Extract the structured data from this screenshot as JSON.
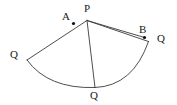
{
  "figure": {
    "type": "geometry-diagram",
    "canvas": {
      "width": 177,
      "height": 105
    },
    "colors": {
      "background": "#ffffff",
      "stroke": "#3a3a3a",
      "label": "#1a1a1a",
      "marker": "#111111"
    },
    "stroke_width": 0.9,
    "labels": [
      {
        "id": "label-P",
        "text": "P",
        "x": 84,
        "y": 3
      },
      {
        "id": "label-A",
        "text": "A",
        "x": 62,
        "y": 11
      },
      {
        "id": "label-B",
        "text": "B",
        "x": 139,
        "y": 24
      },
      {
        "id": "label-Q-right",
        "text": "Q",
        "x": 157,
        "y": 33
      },
      {
        "id": "label-Q-left",
        "text": "Q",
        "x": 10,
        "y": 49
      },
      {
        "id": "label-Q-bottom",
        "text": "Q",
        "x": 90,
        "y": 90
      }
    ],
    "points": {
      "P": {
        "x": 87,
        "y": 20.5
      },
      "A": {
        "x": 73.5,
        "y": 23.5
      },
      "B": {
        "x": 144.5,
        "y": 37.5
      },
      "Q_left": {
        "x": 27,
        "y": 60
      },
      "Q_bottom": {
        "x": 95,
        "y": 87.5
      },
      "Q_right": {
        "x": 148.5,
        "y": 41.5
      }
    },
    "markers": [
      {
        "id": "marker-A",
        "x": 73.5,
        "y": 23.5,
        "r": 1.6
      },
      {
        "id": "marker-B",
        "x": 144.5,
        "y": 37.5,
        "r": 1.6
      }
    ],
    "segments": [
      {
        "id": "segment-P-Qleft",
        "from": "P",
        "to": "Q_left",
        "path": "M 87 20.5 L 27 60"
      },
      {
        "id": "segment-P-Qbottom",
        "from": "P",
        "to": "Q_bottom",
        "path": "M 87 20.5 L 95 87.5"
      },
      {
        "id": "segment-P-Qright",
        "from": "P",
        "to": "Q_right",
        "path": "M 87 20.5 L 148.5 41.5"
      },
      {
        "id": "segment-P-B",
        "from": "P",
        "to": "B",
        "path": "M 87 20.5 L 144.5 37.5"
      }
    ],
    "arc": {
      "id": "sector-arc",
      "path": "M 27 60 Q 48 89 95 87.5 Q 133 86 148.5 41.5",
      "from": "Q_left",
      "through": "Q_bottom",
      "to": "Q_right"
    }
  }
}
